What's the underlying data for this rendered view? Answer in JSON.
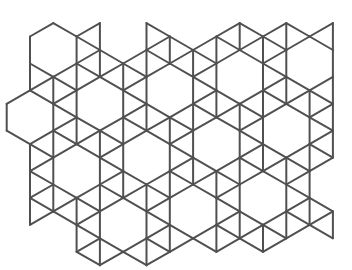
{
  "figure": {
    "background": "#ffffff",
    "stroke_color": "#505050",
    "stroke_width": 2
  },
  "lattice": {
    "origin_x": 30,
    "column_spacing": 23.3,
    "ref_y": 50,
    "half_step": 13.45,
    "ref_hex_column": 1,
    "hex_vector_a": [
      2,
      4
    ],
    "hex_vector_b": [
      3,
      -1
    ]
  },
  "hexagon_centers_observed": [
    [
      53,
      50
    ],
    [
      99,
      103
    ],
    [
      240,
      77
    ],
    [
      310,
      63
    ],
    [
      76,
      170
    ],
    [
      123,
      224
    ],
    [
      263,
      197
    ]
  ],
  "outline": [
    [
      28,
      34
    ],
    [
      53,
      20
    ],
    [
      76,
      33
    ],
    [
      99,
      19
    ],
    [
      123,
      60
    ],
    [
      146,
      19
    ],
    [
      192,
      46
    ],
    [
      216,
      33
    ],
    [
      240,
      19
    ],
    [
      263,
      33
    ],
    [
      286,
      19
    ],
    [
      309,
      33
    ],
    [
      335,
      19
    ],
    [
      335,
      162
    ],
    [
      311,
      176
    ],
    [
      311,
      200
    ],
    [
      335,
      210
    ],
    [
      335,
      246
    ],
    [
      286,
      232
    ],
    [
      263,
      260
    ],
    [
      216,
      260
    ],
    [
      193,
      246
    ],
    [
      170,
      260
    ],
    [
      76,
      260
    ],
    [
      76,
      232
    ],
    [
      28,
      232
    ]
  ]
}
